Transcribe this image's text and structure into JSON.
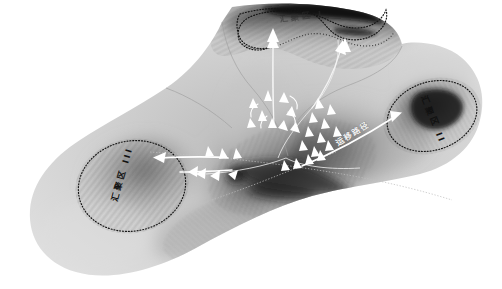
{
  "figure": {
    "type": "geological-structure-map",
    "background_color": "#ffffff",
    "surface_tone_light": "#d8d8d8",
    "surface_tone_mid": "#9a9a9a",
    "surface_tone_dark": "#2b2b2b",
    "arrow_color": "#ffffff",
    "contour_color": "#1a1a1a"
  },
  "labels": {
    "zone_top": "汇聚区 I",
    "zone_right": "汇聚区 II",
    "zone_left": "汇聚区 III",
    "migration_path": "运移路径"
  },
  "zones": [
    {
      "id": "I",
      "name": "汇聚区 I",
      "position": "top-center"
    },
    {
      "id": "II",
      "name": "汇聚区 II",
      "position": "right"
    },
    {
      "id": "III",
      "name": "汇聚区 III",
      "position": "bottom-left"
    }
  ],
  "annotations": {
    "path_label": "运移路径",
    "arrow_count_center": 14,
    "arrow_count_left": 7,
    "arrow_count_right": 6,
    "arrow_count_top": 2
  }
}
